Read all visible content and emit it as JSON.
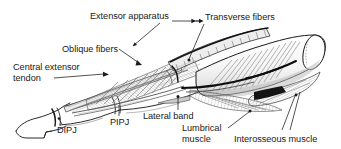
{
  "figure": {
    "type": "anatomical-line-drawing",
    "background_color": "#ffffff",
    "ink_color": "#1a1a1a",
    "shade_color": "#8a8a8a",
    "width": 341,
    "height": 149
  },
  "labels": [
    {
      "id": "extensor-apparatus",
      "text": "Extensor apparatus",
      "x": 90,
      "y": 11,
      "leader": "down-left-arrow-plus-right-line"
    },
    {
      "id": "transverse-fibers",
      "text": "Transverse fibers",
      "x": 205,
      "y": 12,
      "leader": "down-left"
    },
    {
      "id": "oblique-fibers",
      "text": "Oblique fibers",
      "x": 62,
      "y": 44,
      "leader": "down-right-arrow"
    },
    {
      "id": "central-extensor-tendon",
      "text": "Central extensor",
      "x": 13,
      "y": 62,
      "leader": "right-arrow"
    },
    {
      "id": "central-extensor-tendon-2",
      "text": "tendon",
      "x": 13,
      "y": 73,
      "leader": "none"
    },
    {
      "id": "dipj",
      "text": "DIPJ",
      "x": 57,
      "y": 125,
      "leader": "up-dot"
    },
    {
      "id": "pipj",
      "text": "PIPJ",
      "x": 110,
      "y": 117,
      "leader": "up-line"
    },
    {
      "id": "lateral-band",
      "text": "Lateral band",
      "x": 143,
      "y": 111,
      "leader": "up-dot"
    },
    {
      "id": "lumbrical-muscle-1",
      "text": "Lumbrical",
      "x": 182,
      "y": 123,
      "leader": "up-right-dot"
    },
    {
      "id": "lumbrical-muscle-2",
      "text": "muscle",
      "x": 182,
      "y": 134,
      "leader": "none"
    },
    {
      "id": "interosseous-muscle",
      "text": "Interosseous muscle",
      "x": 234,
      "y": 134,
      "leader": "up-left-dot"
    }
  ]
}
